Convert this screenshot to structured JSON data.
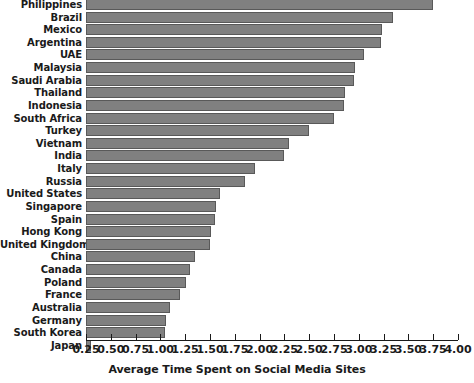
{
  "chart_data": {
    "type": "bar",
    "orientation": "horizontal",
    "title": "",
    "xlabel": "Average Time Spent on Social Media Sites",
    "ylabel": "",
    "xlim": [
      0.25,
      4.0
    ],
    "xticks": [
      "0.25",
      "0.50",
      "0.75",
      "1.00",
      "1.25",
      "1.50",
      "1.75",
      "2.00",
      "2.25",
      "2.50",
      "2.75",
      "3.00",
      "3.25",
      "3.50",
      "3.75",
      "4.00"
    ],
    "xtick_values": [
      0.25,
      0.5,
      0.75,
      1.0,
      1.25,
      1.5,
      1.75,
      2.0,
      2.25,
      2.5,
      2.75,
      3.0,
      3.25,
      3.5,
      3.75,
      4.0
    ],
    "grid": false,
    "legend": null,
    "bar_color": "#808080",
    "bar_edge_color": "#595959",
    "categories": [
      "Philippines",
      "Brazil",
      "Mexico",
      "Argentina",
      "UAE",
      "Malaysia",
      "Saudi Arabia",
      "Thailand",
      "Indonesia",
      "South Africa",
      "Turkey",
      "Vietnam",
      "India",
      "Italy",
      "Russia",
      "United States",
      "Singapore",
      "Spain",
      "Hong Kong",
      "United Kingdom",
      "China",
      "Canada",
      "Poland",
      "France",
      "Australia",
      "Germany",
      "South Korea",
      "Japan"
    ],
    "values": [
      3.75,
      3.34,
      3.23,
      3.22,
      3.05,
      2.96,
      2.95,
      2.86,
      2.85,
      2.75,
      2.5,
      2.3,
      2.25,
      1.95,
      1.85,
      1.6,
      1.56,
      1.55,
      1.51,
      1.5,
      1.35,
      1.3,
      1.26,
      1.2,
      1.1,
      1.06,
      1.05,
      0.3
    ]
  }
}
